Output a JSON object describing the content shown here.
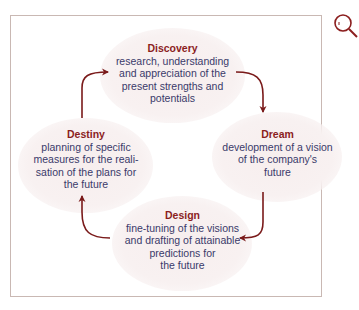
{
  "diagram": {
    "type": "cycle",
    "nodes": [
      {
        "id": "discovery",
        "title": "Discovery",
        "lines": [
          "research, understanding",
          "and appreciation of the",
          "present strengths and",
          "potentials"
        ]
      },
      {
        "id": "dream",
        "title": "Dream",
        "lines": [
          "development of a vision",
          "of the company's",
          "future"
        ]
      },
      {
        "id": "design",
        "title": "Design",
        "lines": [
          "fine-tuning of the visions",
          "and drafting of attainable",
          "predictions for",
          "the future"
        ]
      },
      {
        "id": "destiny",
        "title": "Destiny",
        "lines": [
          "planning of specific",
          "measures for the reali-",
          "sation of the plans for",
          "the future"
        ]
      }
    ],
    "edges": [
      {
        "from": "discovery",
        "to": "dream"
      },
      {
        "from": "dream",
        "to": "design"
      },
      {
        "from": "design",
        "to": "destiny"
      },
      {
        "from": "destiny",
        "to": "discovery"
      }
    ],
    "colors": {
      "title": "#8b1e1e",
      "text": "#3a3a6a",
      "arrow": "#7a1a1a",
      "frame": "#c9b8b3",
      "bubble": "#f7eeee"
    }
  }
}
